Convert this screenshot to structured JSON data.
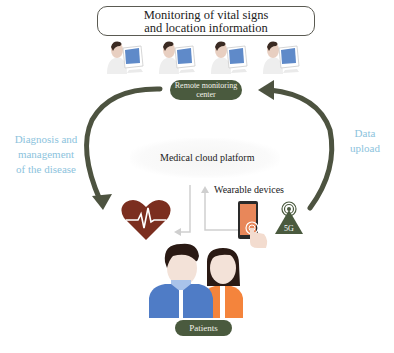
{
  "title": {
    "line1": "Monitoring of vital signs",
    "line2": "and location information"
  },
  "doctors": {
    "count": 4,
    "icon": "doctor-at-monitor-icon"
  },
  "remote_center": {
    "line1": "Remote monitoring",
    "line2": "center"
  },
  "left_flow": {
    "line1": "Diagnosis and",
    "line2": "management",
    "line3": "of the disease",
    "direction": "from remote monitoring center down to patients"
  },
  "right_flow": {
    "line1": "Data",
    "line2": "upload",
    "direction": "from 5G tower up to remote monitoring center"
  },
  "cloud": {
    "label": "Medical cloud platform"
  },
  "wearable": {
    "label": "Wearable devices"
  },
  "tower": {
    "label": "5G"
  },
  "patients": {
    "label": "Patients"
  },
  "colors": {
    "arrow": "#4d5340",
    "pill": "#4a5a3e",
    "side_text": "#8cc3dd",
    "heart": "#7b2e1f",
    "male_shirt": "#4f7cc6",
    "female_shirt": "#f4843c",
    "hair": "#2a1a14",
    "skin": "#f3e2d8",
    "phone_screen": "#e8875a",
    "tower": "#4a5a3e"
  }
}
